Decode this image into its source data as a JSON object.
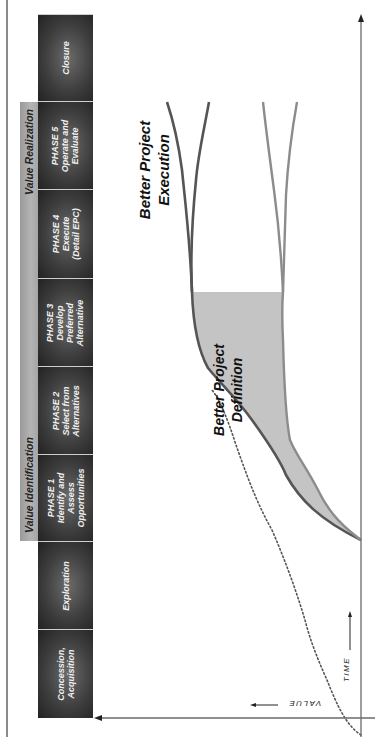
{
  "diagram": {
    "orientation": "rotated 90deg clockwise (time runs bottom-to-top of the page)",
    "stage_groups": [
      {
        "label": "Value Identification",
        "covers": [
          "PHASE 1",
          "PHASE 2",
          "PHASE 3"
        ]
      },
      {
        "label": "Value Realization",
        "covers": [
          "PHASE 4",
          "PHASE 5"
        ]
      }
    ],
    "stages": [
      {
        "lines": [
          "Concession,",
          "Acquisition"
        ]
      },
      {
        "lines": [
          "Exploration"
        ]
      },
      {
        "lines": [
          "PHASE 1",
          "Identify and",
          "Assess",
          "Opportunities"
        ]
      },
      {
        "lines": [
          "PHASE 2",
          "Select from",
          "Alternatives"
        ]
      },
      {
        "lines": [
          "PHASE 3",
          "Develop",
          "Preferred",
          "Alternative"
        ]
      },
      {
        "lines": [
          "PHASE 4",
          "Execute",
          "(Detail EPC)"
        ]
      },
      {
        "lines": [
          "PHASE 5",
          "Operate and",
          "Evaluate"
        ]
      },
      {
        "lines": [
          "Closure"
        ]
      }
    ],
    "regions": {
      "execution": [
        "Better Project",
        "Execution"
      ],
      "definition": [
        "Better Project",
        "Definition"
      ]
    },
    "axes": {
      "value": "VALUE",
      "time": "TIME"
    },
    "colors": {
      "box_dark": "#3a3a3a",
      "band": "#a8a8a8",
      "curve_dark": "#555555",
      "curve_light": "#8c8c8c",
      "shade": "#c4c4c4",
      "dotted": "#555555"
    }
  }
}
